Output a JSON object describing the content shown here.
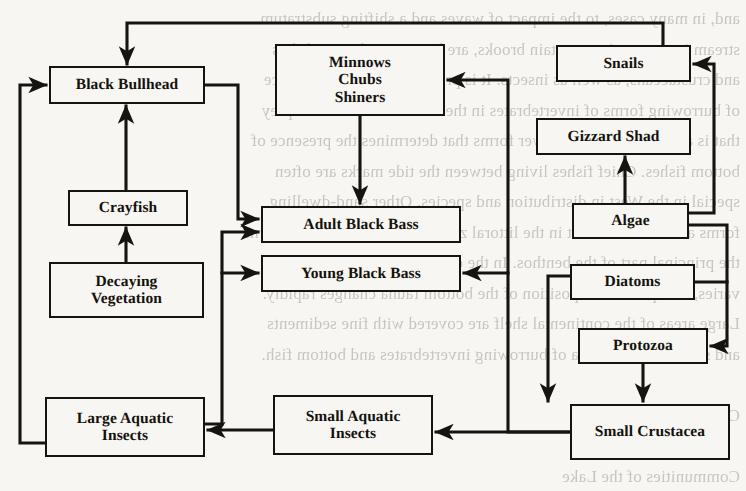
{
  "diagram": {
    "type": "flow-diagram",
    "background_color": "#f7f6f2",
    "ink_color": "#16140f",
    "page_bleed_text": "and, in many cases, to the impact of waves and a shifting substratum.\nstream insects, as in mountain brooks, are lower vertebrates, fishes\nand crustaceans, as well as insects. It is probable that the abundance\nof burrowing forms of invertebrates in the sand is related to the prey\nthat is available to them. Lower forms that determines the presence of\nbottom fishes. Chief fishes living between the tide marks are often\nspecial in the West in distribution and species. Other sand-dwelling\nforms are most abundant in the littoral zone and, on many coasts, form\nthe principal part of the benthos. In the estuaries, where the salinity\nvaries, the species composition of the bottom fauna changes rapidly.\nLarge areas of the continental shelf are covered with fine sediments\nand support a rich fauna of burrowing invertebrates and bottom fish.\n\nChapter IV\n\nCommunities of the Lake\n\nIn the preceding chapters we have considered the general nature\nof aquatic communities. This chapter presents the diagram of a food\nweb in a small lake and discusses the relationships shown in the\ndiagram as they apply to the community as a whole.",
    "nodes": [
      {
        "id": "black-bullhead",
        "label": "Black Bullhead",
        "x": 49,
        "y": 66,
        "w": 156,
        "h": 38
      },
      {
        "id": "minnows-chubs-shiners",
        "label": "Minnows\nChubs\nShiners",
        "x": 275,
        "y": 44,
        "w": 170,
        "h": 72
      },
      {
        "id": "snails",
        "label": "Snails",
        "x": 556,
        "y": 45,
        "w": 135,
        "h": 37
      },
      {
        "id": "gizzard-shad",
        "label": "Gizzard Shad",
        "x": 536,
        "y": 118,
        "w": 155,
        "h": 37
      },
      {
        "id": "crayfish",
        "label": "Crayfish",
        "x": 68,
        "y": 190,
        "w": 120,
        "h": 36
      },
      {
        "id": "adult-black-bass",
        "label": "Adult Black Bass",
        "x": 261,
        "y": 206,
        "w": 200,
        "h": 37
      },
      {
        "id": "algae",
        "label": "Algae",
        "x": 572,
        "y": 203,
        "w": 117,
        "h": 36
      },
      {
        "id": "young-black-bass",
        "label": "Young Black Bass",
        "x": 261,
        "y": 255,
        "w": 200,
        "h": 37
      },
      {
        "id": "diatoms",
        "label": "Diatoms",
        "x": 570,
        "y": 264,
        "w": 125,
        "h": 36
      },
      {
        "id": "decaying-vegetation",
        "label": "Decaying\nVegetation",
        "x": 49,
        "y": 262,
        "w": 155,
        "h": 56
      },
      {
        "id": "protozoa",
        "label": "Protozoa",
        "x": 578,
        "y": 328,
        "w": 130,
        "h": 36
      },
      {
        "id": "large-aquatic-insects",
        "label": "Large Aquatic\nInsects",
        "x": 45,
        "y": 397,
        "w": 160,
        "h": 60
      },
      {
        "id": "small-aquatic-insects",
        "label": "Small Aquatic\nInsects",
        "x": 273,
        "y": 395,
        "w": 160,
        "h": 60
      },
      {
        "id": "small-crustacea",
        "label": "Small Crustacea",
        "x": 570,
        "y": 404,
        "w": 160,
        "h": 56
      }
    ],
    "edges": [
      {
        "id": "snails-to-black-bullhead",
        "from": "snails",
        "to": "black-bullhead",
        "route": "top-loop"
      },
      {
        "id": "algae-to-snails",
        "from": "algae",
        "to": "snails",
        "route": "right-up"
      },
      {
        "id": "algae-to-gizzard-shad",
        "from": "algae",
        "to": "gizzard-shad",
        "route": "vertical-up"
      },
      {
        "id": "algae-to-protozoa",
        "from": "algae",
        "to": "protozoa",
        "route": "right-down"
      },
      {
        "id": "diatoms-to-protozoa",
        "from": "diatoms",
        "to": "protozoa",
        "route": "right-down"
      },
      {
        "id": "diatoms-to-small-crustacea",
        "from": "diatoms",
        "to": "small-crustacea",
        "route": "left-down"
      },
      {
        "id": "protozoa-to-small-crustacea",
        "from": "protozoa",
        "to": "small-crustacea",
        "route": "vertical-down"
      },
      {
        "id": "small-crustacea-to-young-black-bass",
        "from": "small-crustacea",
        "to": "young-black-bass",
        "route": "left-up"
      },
      {
        "id": "small-crustacea-to-minnows",
        "from": "small-crustacea",
        "to": "minnows-chubs-shiners",
        "route": "left-up-far"
      },
      {
        "id": "small-crustacea-to-small-aq-insects",
        "from": "small-crustacea",
        "to": "small-aquatic-insects",
        "route": "horizontal-left"
      },
      {
        "id": "small-aq-insects-to-large-aq-insects",
        "from": "small-aquatic-insects",
        "to": "large-aquatic-insects",
        "route": "horizontal-left"
      },
      {
        "id": "large-aq-insects-to-black-bullhead",
        "from": "large-aquatic-insects",
        "to": "black-bullhead",
        "route": "left-up"
      },
      {
        "id": "large-aq-insects-to-adult-black-bass",
        "from": "large-aquatic-insects",
        "to": "adult-black-bass",
        "route": "right-up"
      },
      {
        "id": "large-aq-insects-to-young-black-bass",
        "from": "large-aquatic-insects",
        "to": "young-black-bass",
        "route": "right-up"
      },
      {
        "id": "decaying-veg-to-crayfish",
        "from": "decaying-vegetation",
        "to": "crayfish",
        "route": "vertical-up"
      },
      {
        "id": "crayfish-to-black-bullhead",
        "from": "crayfish",
        "to": "black-bullhead",
        "route": "vertical-up"
      },
      {
        "id": "black-bullhead-to-adult-black-bass",
        "from": "black-bullhead",
        "to": "adult-black-bass",
        "route": "right-down"
      },
      {
        "id": "minnows-to-adult-black-bass",
        "from": "minnows-chubs-shiners",
        "to": "adult-black-bass",
        "route": "vertical-down"
      }
    ]
  }
}
